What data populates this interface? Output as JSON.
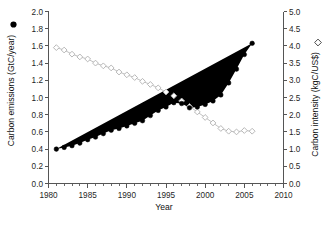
{
  "chart_data": {
    "type": "line",
    "title": "",
    "xlabel": "Year",
    "ylabel": "Carbon emissions (GtC/year)",
    "y2label": "Carbon intensity (kgC/US$)",
    "xlim": [
      1980,
      2010
    ],
    "ylim": [
      0.0,
      2.0
    ],
    "y2lim": [
      0.0,
      5.0
    ],
    "grid": false,
    "legend_position": "inline-axis-labels",
    "xticks": [
      1980,
      1985,
      1990,
      1995,
      2000,
      2005,
      2010
    ],
    "xtick_labels": [
      "1980",
      "1985",
      "1990",
      "1995",
      "2000",
      "2005",
      "2010"
    ],
    "xminor_step": 1,
    "yticks": [
      0.0,
      0.2,
      0.4,
      0.6,
      0.8,
      1.0,
      1.2,
      1.4,
      1.6,
      1.8,
      2.0
    ],
    "ytick_labels": [
      "0.0",
      "0.2",
      "0.4",
      "0.6",
      "0.8",
      "1.0",
      "1.2",
      "1.4",
      "1.6",
      "1.8",
      "2.0"
    ],
    "y2ticks": [
      0.0,
      0.5,
      1.0,
      1.5,
      2.0,
      2.5,
      3.0,
      3.5,
      4.0,
      4.5,
      5.0
    ],
    "y2tick_labels": [
      "0.0",
      "0.5",
      "1.0",
      "1.5",
      "2.0",
      "2.5",
      "3.0",
      "3.5",
      "4.0",
      "4.5",
      "5.0"
    ],
    "x": [
      1981,
      1982,
      1983,
      1984,
      1985,
      1986,
      1987,
      1988,
      1989,
      1990,
      1991,
      1992,
      1993,
      1994,
      1995,
      1996,
      1997,
      1998,
      1999,
      2000,
      2001,
      2002,
      2003,
      2004,
      2005,
      2006
    ],
    "series": [
      {
        "name": "Carbon emissions (GtC/year)",
        "axis": "left",
        "marker": "filled-circle",
        "color": "#000000",
        "units": "GtC/year",
        "values": [
          0.4,
          0.42,
          0.44,
          0.47,
          0.51,
          0.54,
          0.58,
          0.62,
          0.64,
          0.67,
          0.7,
          0.73,
          0.79,
          0.85,
          0.89,
          0.94,
          0.93,
          0.88,
          0.89,
          0.92,
          0.96,
          1.03,
          1.17,
          1.33,
          1.5,
          1.63
        ]
      },
      {
        "name": "Carbon intensity (kgC/US$)",
        "axis": "right",
        "marker": "open-diamond",
        "color": "#b9b9b9",
        "units": "kgC/US$",
        "values": [
          3.95,
          3.88,
          3.76,
          3.68,
          3.62,
          3.5,
          3.42,
          3.36,
          3.24,
          3.16,
          3.08,
          2.97,
          2.88,
          2.78,
          2.66,
          2.55,
          2.4,
          2.24,
          2.08,
          1.92,
          1.76,
          1.6,
          1.52,
          1.5,
          1.54,
          1.52
        ]
      }
    ]
  },
  "figure": {
    "background_color": "#ffffff",
    "axis_color": "#555555",
    "emissions_marker_legend": "●",
    "intensity_marker_legend": "◇"
  }
}
